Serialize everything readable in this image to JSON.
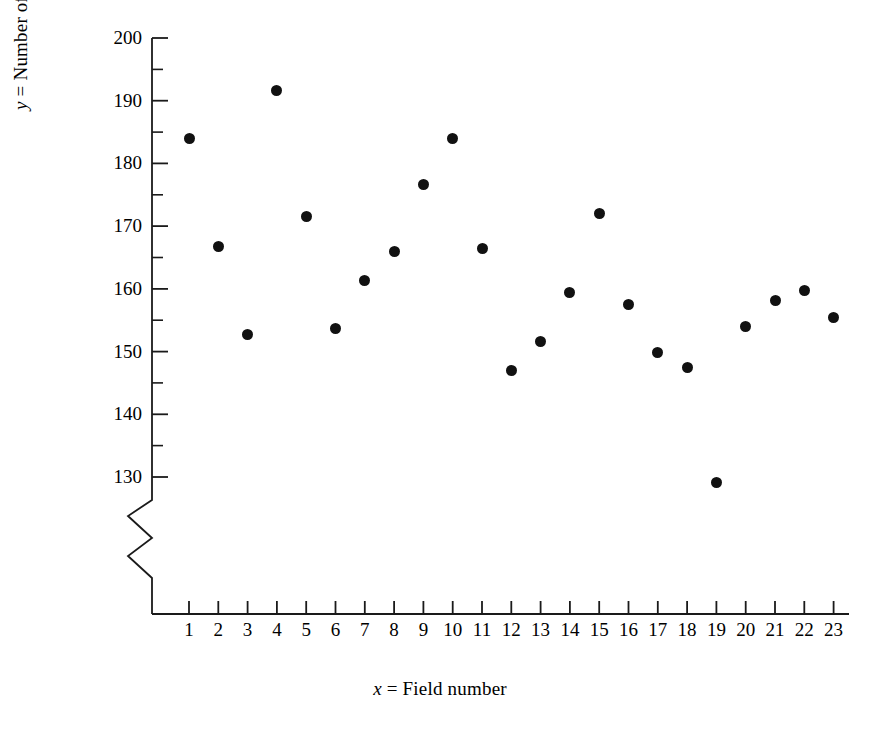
{
  "chart_data": {
    "type": "scatter",
    "title": "",
    "xlabel": "x  =  Field number",
    "xlabel_var": "x",
    "xlabel_rest": "  =  Field number",
    "ylabel": "y  =  Number of pollen grains per field",
    "ylabel_var": "y",
    "ylabel_rest": "  =  Number of pollen grains per field",
    "categories": [
      1,
      2,
      3,
      4,
      5,
      6,
      7,
      8,
      9,
      10,
      11,
      12,
      13,
      14,
      15,
      16,
      17,
      18,
      19,
      20,
      21,
      22,
      23
    ],
    "x": [
      1,
      2,
      3,
      4,
      5,
      6,
      7,
      8,
      9,
      10,
      11,
      12,
      13,
      14,
      15,
      16,
      17,
      18,
      19,
      20,
      21,
      22,
      23
    ],
    "values": [
      184,
      166.7,
      152.8,
      191.7,
      171.6,
      153.7,
      161.4,
      166,
      176.7,
      184,
      166.4,
      147,
      151.6,
      159.4,
      172,
      157.5,
      149.8,
      147.5,
      129.2,
      154,
      158.2,
      159.7,
      155.4
    ],
    "xtick_labels": [
      "1",
      "2",
      "3",
      "4",
      "5",
      "6",
      "7",
      "8",
      "9",
      "10",
      "11",
      "12",
      "13",
      "14",
      "15",
      "16",
      "17",
      "18",
      "19",
      "20",
      "21",
      "22",
      "23"
    ],
    "ytick_labels": [
      "200",
      "190",
      "180",
      "170",
      "160",
      "150",
      "140",
      "130"
    ],
    "ytick_values": [
      200,
      190,
      180,
      170,
      160,
      150,
      140,
      130
    ],
    "yminor_values": [
      195,
      185,
      175,
      165,
      155,
      145,
      135
    ],
    "ylim": [
      130,
      200
    ],
    "xlim": [
      0,
      23
    ],
    "axis_break": true,
    "axis_break_note": "zigzag break on y-axis below 130",
    "grid": false,
    "legend": null,
    "marker": "filled-circle",
    "marker_color": "#111111"
  }
}
